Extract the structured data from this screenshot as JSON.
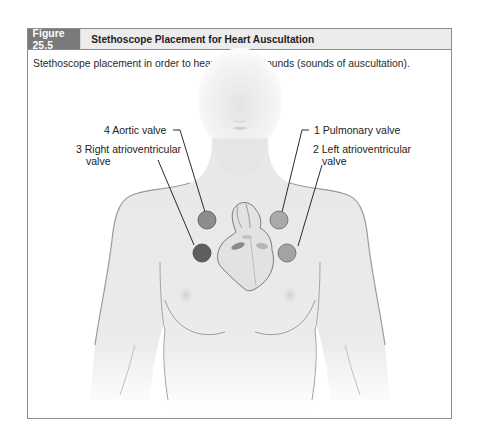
{
  "figure": {
    "number": "Figure 25.5",
    "title": "Stethoscope Placement for Heart Auscultation",
    "caption": "Stethoscope placement in order to hear the heart sounds (sounds of auscultation)."
  },
  "labels": [
    {
      "id": "aortic",
      "text": "4 Aortic valve",
      "order": 4,
      "circle_color": "#8c8c8c"
    },
    {
      "id": "right-av",
      "line1": "3 Right atrioventricular",
      "line2": "valve",
      "order": 3,
      "circle_color": "#5e5e5e"
    },
    {
      "id": "pulmonary",
      "text": "1 Pulmonary valve",
      "order": 1,
      "circle_color": "#a9a9a9"
    },
    {
      "id": "left-av",
      "line1": "2 Left atrioventricular",
      "line2": "valve",
      "order": 2,
      "circle_color": "#a3a3a3"
    }
  ],
  "colors": {
    "header_number_bg": "#7a7a7a",
    "header_bg": "#ececec",
    "border": "#8c8c8c",
    "skin": "#e9e9e9",
    "outline": "#9a9a9a"
  }
}
